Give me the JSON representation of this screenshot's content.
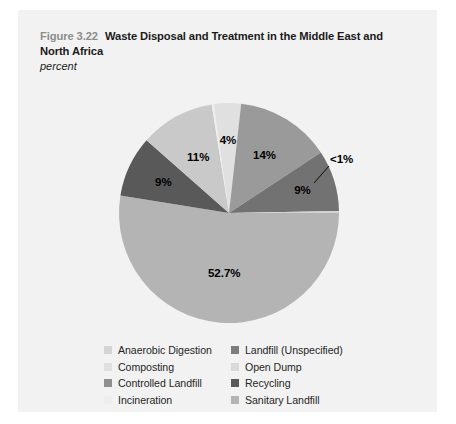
{
  "card": {
    "background": "#f2f2f2"
  },
  "header": {
    "figure_number": "Figure 3.22",
    "title": "Waste Disposal and Treatment in the Middle East and North Africa",
    "subtitle": "percent"
  },
  "chart_data": {
    "type": "pie",
    "title": "Waste Disposal and Treatment in the Middle East and North Africa",
    "subtitle": "percent",
    "unit": "percent",
    "legend_position": "bottom",
    "grid": false,
    "start_angle_deg": -8,
    "categories": [
      "Composting",
      "Landfill (Unspecified)",
      "Sanitary Landfill",
      "Anaerobic Digestion",
      "Open Dump",
      "Recycling",
      "Controlled Landfill",
      "Incineration"
    ],
    "values": [
      4,
      14,
      9,
      0.3,
      52.7,
      9,
      11,
      0.3
    ],
    "labels": [
      "4%",
      "14%",
      "9%",
      "<1%",
      "52.7%",
      "9%",
      "11%",
      ""
    ],
    "colors": [
      "#e0e0e0",
      "#9a9a9a",
      "#727272",
      "#d4d4d4",
      "#b4b4b4",
      "#595959",
      "#c9c9c9",
      "#ededed"
    ],
    "slices": [
      {
        "name": "Composting",
        "value": 4,
        "label": "4%",
        "color": "#e0e0e0"
      },
      {
        "name": "Landfill (Unspecified)",
        "value": 14,
        "label": "14%",
        "color": "#9a9a9a"
      },
      {
        "name": "Sanitary Landfill",
        "value": 9,
        "label": "9%",
        "color": "#727272"
      },
      {
        "name": "Anaerobic Digestion",
        "value": 0.3,
        "label": "<1%",
        "color": "#d4d4d4"
      },
      {
        "name": "Open Dump",
        "value": 52.7,
        "label": "52.7%",
        "color": "#b4b4b4"
      },
      {
        "name": "Recycling",
        "value": 9,
        "label": "9%",
        "color": "#595959"
      },
      {
        "name": "Controlled Landfill",
        "value": 11,
        "label": "11%",
        "color": "#c9c9c9"
      },
      {
        "name": "Incineration",
        "value": 0.3,
        "label": "",
        "color": "#ededed"
      }
    ]
  },
  "legend": {
    "left_column": [
      {
        "label": "Anaerobic Digestion",
        "color": "#d4d4d4"
      },
      {
        "label": "Composting",
        "color": "#e0e0e0"
      },
      {
        "label": "Controlled Landfill",
        "color": "#8f8f8f"
      },
      {
        "label": "Incineration",
        "color": "#ededed"
      }
    ],
    "right_column": [
      {
        "label": "Landfill (Unspecified)",
        "color": "#7d7d7d"
      },
      {
        "label": "Open Dump",
        "color": "#d9d9d9"
      },
      {
        "label": "Recycling",
        "color": "#595959"
      },
      {
        "label": "Sanitary Landfill",
        "color": "#b4b4b4"
      }
    ]
  }
}
